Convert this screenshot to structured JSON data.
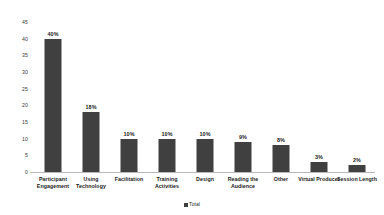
{
  "chart_data": {
    "type": "bar",
    "title": "",
    "subtitle": "",
    "xlabel": "",
    "ylabel": "",
    "ylim": [
      0,
      45
    ],
    "ytick_step": 5,
    "yticks": [
      "45",
      "40",
      "35",
      "30",
      "25",
      "20",
      "15",
      "10",
      "5",
      "0"
    ],
    "grid": false,
    "legend_position": "bottom",
    "categories": [
      "Participant Engagement",
      "Using Technology",
      "Facilitation",
      "Training Activities",
      "Design",
      "Reading the Audience",
      "Other",
      "Virtual Producer",
      "Session Length"
    ],
    "values": [
      40,
      18,
      10,
      10,
      10,
      9,
      8,
      3,
      2
    ],
    "data_labels": [
      "40%",
      "18%",
      "10%",
      "10%",
      "10%",
      "9%",
      "8%",
      "3%",
      "2%"
    ],
    "series": [
      {
        "name": "Total",
        "values": [
          40,
          18,
          10,
          10,
          10,
          9,
          8,
          3,
          2
        ],
        "color": "#404040"
      }
    ]
  },
  "legend": {
    "items": [
      {
        "label": "Total",
        "color": "#404040"
      }
    ]
  },
  "colors": {
    "bar": "#404040",
    "axis": "#b8b8b8",
    "background": "#ffffff",
    "tick_text": "#3a3a3a",
    "label_text": "#1a1a1a"
  }
}
